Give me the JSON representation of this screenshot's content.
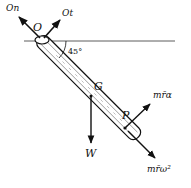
{
  "diagram": {
    "labels": {
      "On": "On",
      "Ot": "Ot",
      "O": "O",
      "angle": "45°",
      "G": "G",
      "P": "P",
      "W": "W",
      "tangential": "mr̄α",
      "normal": "mr̄ω²"
    }
  }
}
